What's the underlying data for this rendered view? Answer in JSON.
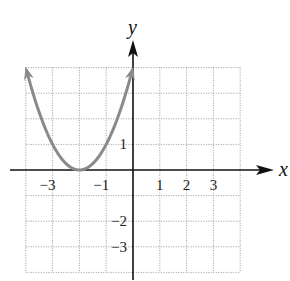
{
  "chart_data": {
    "type": "line",
    "title": "",
    "xlabel": "x",
    "ylabel": "y",
    "xlim": [
      -4,
      4
    ],
    "ylim": [
      -4,
      4
    ],
    "grid": true,
    "grid_style": "dotted",
    "x_tick_labels": [
      {
        "value": -3,
        "label": "−3"
      },
      {
        "value": -1,
        "label": "−1"
      },
      {
        "value": 1,
        "label": "1"
      },
      {
        "value": 2,
        "label": "2"
      },
      {
        "value": 3,
        "label": "3"
      }
    ],
    "y_tick_labels": [
      {
        "value": 1,
        "label": "1"
      },
      {
        "value": -2,
        "label": "−2"
      },
      {
        "value": -3,
        "label": "−3"
      }
    ],
    "series": [
      {
        "name": "parabola",
        "description": "Upward-opening parabola with vertex at (-2, 0), arrows at both ends",
        "equation": "y = (x + 2)^2",
        "x": [
          -4,
          -3.5,
          -3,
          -2.5,
          -2,
          -1.5,
          -1,
          -0.5,
          0
        ],
        "y": [
          4,
          2.25,
          1,
          0.25,
          0,
          0.25,
          1,
          2.25,
          4
        ],
        "color": "#8a8a8a"
      }
    ],
    "vertex": [
      -2,
      0
    ],
    "legend": "none"
  },
  "colors": {
    "axis": "#111111",
    "grid": "#9a9a9a",
    "curve": "#8a8a8a"
  }
}
